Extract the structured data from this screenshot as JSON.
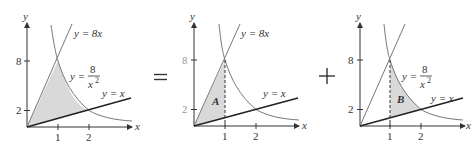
{
  "operators": {
    "equals": "=",
    "plus": "+"
  },
  "panels": [
    {
      "id": "total-region",
      "axis_labels": {
        "x": "x",
        "y": "y"
      },
      "y_ticks": [
        "8",
        "2"
      ],
      "x_ticks": [
        "1",
        "2"
      ],
      "curve_labels": {
        "line8x": "y = 8x",
        "hyperbola_lhs": "y =",
        "hyperbola_num": "8",
        "hyperbola_den": "x",
        "hyperbola_exp": "2",
        "linex": "y = x"
      },
      "region_label": ""
    },
    {
      "id": "region-A",
      "axis_labels": {
        "x": "x",
        "y": "y"
      },
      "y_ticks": [
        "8",
        "2"
      ],
      "x_ticks": [
        "1",
        "2"
      ],
      "curve_labels": {
        "line8x": "y = 8x",
        "linex": "y = x"
      },
      "region_label": "A"
    },
    {
      "id": "region-B",
      "axis_labels": {
        "x": "x",
        "y": "y"
      },
      "y_ticks": [
        "8",
        "2"
      ],
      "x_ticks": [
        "1",
        "2"
      ],
      "curve_labels": {
        "hyperbola_lhs": "y =",
        "hyperbola_num": "8",
        "hyperbola_den": "x",
        "hyperbola_exp": "2",
        "linex": "y = x"
      },
      "region_label": "B"
    }
  ],
  "colors": {
    "shade": "#d9d9d9",
    "axis": "#333333",
    "curve": "#777777"
  }
}
